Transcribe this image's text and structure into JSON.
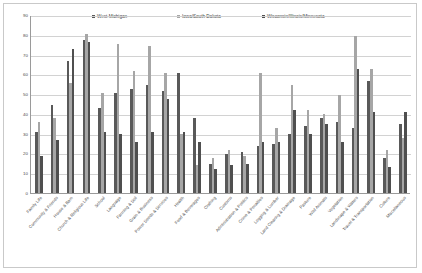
{
  "chart_data": {
    "type": "bar",
    "title": "",
    "subtitle": "",
    "xlabel": "",
    "ylabel": "",
    "ylim": [
      0,
      90
    ],
    "ytick_step": 10,
    "yticks": [
      "0",
      "10",
      "20",
      "30",
      "40",
      "50",
      "60",
      "70",
      "80",
      "90"
    ],
    "grid": true,
    "legend_position": "top",
    "orientation": "vertical",
    "series_colors": [
      "#595959",
      "#a6a6a6",
      "#4f4f4f"
    ],
    "categories": [
      "Family Life",
      "Community & Friends",
      "House & Barn",
      "Church & Religious Life",
      "School",
      "Language",
      "Farming & Soil",
      "Grain & Business",
      "Power Seeds & Services",
      "Health",
      "Food & Beverages",
      "Clothing",
      "Customs",
      "Administration & Politics",
      "Crime & Penalties",
      "Logging & Lumber",
      "Land Clearing & Drainage",
      "Pasture",
      "Wild Animals",
      "Vegetation",
      "Landscape & Waters",
      "Travel & Transportation",
      "Culture",
      "Miscellaneous"
    ],
    "series": [
      {
        "name": "West Michigan",
        "values": [
          31,
          45,
          67,
          78,
          43,
          51,
          53,
          55,
          52,
          61,
          38,
          15,
          20,
          21,
          24,
          25,
          30,
          34,
          38,
          36,
          33,
          57,
          18,
          35
        ]
      },
      {
        "name": "Iowa/South Dakota",
        "values": [
          36,
          38,
          56,
          81,
          51,
          76,
          62,
          75,
          61,
          30,
          14,
          18,
          22,
          19,
          61,
          33,
          55,
          42,
          40,
          50,
          80,
          63,
          22,
          28
        ]
      },
      {
        "name": "Wisconsin/Illinois/Minnesota",
        "values": [
          19,
          27,
          73,
          77,
          31,
          30,
          26,
          31,
          48,
          31,
          26,
          12,
          14,
          15,
          26,
          26,
          42,
          30,
          35,
          26,
          63,
          41,
          13,
          41
        ]
      }
    ]
  },
  "legend": {
    "items": [
      {
        "label": "West Michigan",
        "color": "#595959"
      },
      {
        "label": "Iowa/South Dakota",
        "color": "#a6a6a6"
      },
      {
        "label": "Wisconsin/Illinois/Minnesota",
        "color": "#4f4f4f"
      }
    ]
  }
}
